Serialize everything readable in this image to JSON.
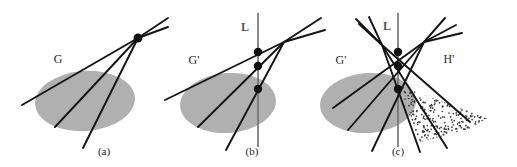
{
  "figure": {
    "width": 517,
    "height": 167,
    "background": "#ffffff",
    "colors": {
      "line_stroke": "#141414",
      "ellipse_fill": "#b0b0b0",
      "vertical_line": "#6e6e6e",
      "point_fill": "#111111",
      "stipple_dot": "#3a3a3a",
      "caption_text": "#1a1a1a",
      "set_label_text": "#2b2b2b",
      "line_label_text": "#555555"
    }
  },
  "panels": [
    {
      "id": "panel-a",
      "caption": "(a)",
      "caption_pos": {
        "x": 104,
        "y": 155
      },
      "labels": [
        {
          "name": "set-label-G",
          "text": "G",
          "x": 58,
          "y": 63,
          "kind": "set"
        }
      ],
      "ellipse": {
        "cx": 85,
        "cy": 101,
        "rx": 50,
        "ry": 30,
        "rotation": -4
      },
      "apex": {
        "x": 138,
        "y": 38
      },
      "lines": [
        {
          "x1": 138,
          "y1": 38,
          "x2": 22,
          "y2": 105
        },
        {
          "x1": 138,
          "y1": 38,
          "x2": 55,
          "y2": 127
        },
        {
          "x1": 138,
          "y1": 38,
          "x2": 83,
          "y2": 148
        },
        {
          "x1": 138,
          "y1": 38,
          "x2": 168,
          "y2": 18
        },
        {
          "x1": 138,
          "y1": 38,
          "x2": 168,
          "y2": 27
        }
      ],
      "points": [
        {
          "x": 138,
          "y": 38,
          "r": 4.5
        }
      ]
    },
    {
      "id": "panel-b",
      "caption": "(b)",
      "caption_pos": {
        "x": 252,
        "y": 155
      },
      "labels": [
        {
          "name": "set-label-Gprime",
          "text": "G'",
          "x": 194,
          "y": 64,
          "kind": "set"
        },
        {
          "name": "line-label-L",
          "text": "L",
          "x": 245,
          "y": 31,
          "kind": "line"
        }
      ],
      "ellipse": {
        "cx": 228,
        "cy": 103,
        "rx": 48,
        "ry": 30,
        "rotation": -4
      },
      "vertical_line": {
        "x": 258,
        "y1": 13,
        "y2": 147
      },
      "apex": {
        "x": 284,
        "y": 42
      },
      "lines": [
        {
          "x1": 284,
          "y1": 42,
          "x2": 165,
          "y2": 100
        },
        {
          "x1": 284,
          "y1": 42,
          "x2": 198,
          "y2": 127
        },
        {
          "x1": 284,
          "y1": 42,
          "x2": 226,
          "y2": 150
        },
        {
          "x1": 284,
          "y1": 42,
          "x2": 321,
          "y2": 18
        },
        {
          "x1": 284,
          "y1": 42,
          "x2": 325,
          "y2": 30
        }
      ],
      "points": [
        {
          "x": 258,
          "y": 52,
          "r": 4.2
        },
        {
          "x": 258,
          "y": 66,
          "r": 4.2
        },
        {
          "x": 258,
          "y": 89,
          "r": 4.2
        }
      ]
    },
    {
      "id": "panel-c",
      "caption": "(c)",
      "caption_pos": {
        "x": 398,
        "y": 155
      },
      "labels": [
        {
          "name": "set-label-Gprime",
          "text": "G'",
          "x": 341,
          "y": 64,
          "kind": "set"
        },
        {
          "name": "set-label-Hprime",
          "text": "H'",
          "x": 449,
          "y": 63,
          "kind": "set"
        },
        {
          "name": "line-label-L",
          "text": "L",
          "x": 387,
          "y": 30,
          "kind": "line"
        }
      ],
      "ellipse": {
        "cx": 368,
        "cy": 103,
        "rx": 48,
        "ry": 30,
        "rotation": -4
      },
      "vertical_line": {
        "x": 398,
        "y1": 13,
        "y2": 147
      },
      "apex_left": {
        "x": 382,
        "y": 45
      },
      "apex_right": {
        "x": 424,
        "y": 42
      },
      "lines_left_fan": [
        {
          "x1": 382,
          "y1": 45,
          "x2": 356,
          "y2": 19
        },
        {
          "x1": 382,
          "y1": 45,
          "x2": 359,
          "y2": 24
        },
        {
          "x1": 382,
          "y1": 45,
          "x2": 369,
          "y2": 17
        }
      ],
      "lines_right_fan": [
        {
          "x1": 424,
          "y1": 42,
          "x2": 445,
          "y2": 18
        },
        {
          "x1": 424,
          "y1": 42,
          "x2": 456,
          "y2": 25
        },
        {
          "x1": 424,
          "y1": 42,
          "x2": 462,
          "y2": 33
        }
      ],
      "lines_from_left_apex": [
        {
          "x1": 382,
          "y1": 45,
          "x2": 470,
          "y2": 122
        },
        {
          "x1": 382,
          "y1": 45,
          "x2": 447,
          "y2": 148
        },
        {
          "x1": 382,
          "y1": 45,
          "x2": 420,
          "y2": 152
        }
      ],
      "lines_from_right_apex": [
        {
          "x1": 424,
          "y1": 42,
          "x2": 333,
          "y2": 108
        },
        {
          "x1": 424,
          "y1": 42,
          "x2": 348,
          "y2": 130
        },
        {
          "x1": 424,
          "y1": 42,
          "x2": 372,
          "y2": 151
        }
      ],
      "points": [
        {
          "x": 398,
          "y": 52,
          "r": 4.2
        },
        {
          "x": 398,
          "y": 66,
          "r": 4.2
        },
        {
          "x": 398,
          "y": 89,
          "r": 4.2
        }
      ],
      "stipple_region": {
        "name": "stipple-wedge-Hprime",
        "polygon": "400,86 487,118 470,129 420,142 402,97",
        "dot_count": 430,
        "dot_radius": 0.85
      }
    }
  ]
}
